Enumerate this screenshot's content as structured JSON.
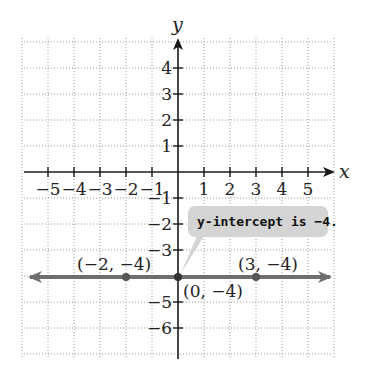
{
  "chart_data": {
    "type": "line",
    "title": "",
    "xlabel": "x",
    "ylabel": "y",
    "xlim": [
      -6,
      6
    ],
    "ylim": [
      -7,
      5
    ],
    "grid": true,
    "grid_style": "dotted",
    "x_ticks": [
      -5,
      -4,
      -3,
      -2,
      -1,
      1,
      2,
      3,
      4,
      5
    ],
    "y_ticks": [
      4,
      3,
      2,
      1,
      -1,
      -2,
      -3,
      -5,
      -6
    ],
    "x_tick_labels": [
      "−5",
      "−4",
      "−3",
      "−2",
      "−1",
      "1",
      "2",
      "3",
      "4",
      "5"
    ],
    "y_tick_labels": [
      "4",
      "3",
      "2",
      "1",
      "−1",
      "−2",
      "−3",
      "−5",
      "−6"
    ],
    "series": [
      {
        "name": "y = -4",
        "kind": "horizontal line with arrows",
        "equation": "y = -4",
        "color": "#6e6e6e",
        "points": [
          {
            "x": -2,
            "y": -4,
            "label": "(−2, −4)"
          },
          {
            "x": 0,
            "y": -4,
            "label": "(0, −4)"
          },
          {
            "x": 3,
            "y": -4,
            "label": "(3, −4)"
          }
        ]
      }
    ],
    "annotations": [
      {
        "text": "y-intercept is −4.",
        "points_to": {
          "x": 0,
          "y": -4
        },
        "style": "callout",
        "background": "#d4d4d4"
      }
    ]
  },
  "labels": {
    "x_axis": "x",
    "y_axis": "y",
    "callout": "y-intercept is −4.",
    "point_a": "(−2, −4)",
    "point_b": "(0, −4)",
    "point_c": "(3, −4)"
  },
  "colors": {
    "line": "#6e6e6e",
    "point": "#555555",
    "callout_bg": "#d4d4d4",
    "grid": "#9a9a9a",
    "axis": "#1a1a1a"
  }
}
